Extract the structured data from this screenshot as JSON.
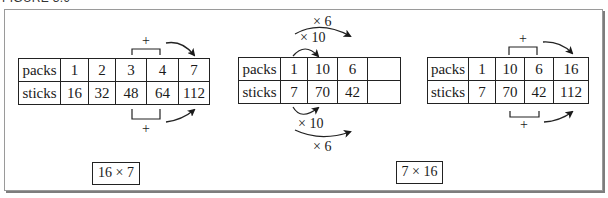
{
  "figure": {
    "title": "FIGURE 3.9"
  },
  "tables": [
    {
      "id": "left",
      "rows": [
        {
          "label": "packs",
          "values": [
            "1",
            "2",
            "3",
            "4",
            "7"
          ]
        },
        {
          "label": "sticks",
          "values": [
            "16",
            "32",
            "48",
            "64",
            "112"
          ]
        }
      ],
      "annotations": {
        "top_operator": "+",
        "bottom_operator": "+"
      },
      "result_label": "16 × 7"
    },
    {
      "id": "middle",
      "rows": [
        {
          "label": "packs",
          "values": [
            "1",
            "10",
            "6",
            ""
          ]
        },
        {
          "label": "sticks",
          "values": [
            "7",
            "70",
            "42",
            ""
          ]
        }
      ],
      "annotations": {
        "top_inner_operator": "× 10",
        "top_outer_operator": "× 6",
        "bottom_inner_operator": "× 10",
        "bottom_outer_operator": "× 6"
      }
    },
    {
      "id": "right",
      "rows": [
        {
          "label": "packs",
          "values": [
            "1",
            "10",
            "6",
            "16"
          ]
        },
        {
          "label": "sticks",
          "values": [
            "7",
            "70",
            "42",
            "112"
          ]
        }
      ],
      "annotations": {
        "top_operator": "+",
        "bottom_operator": "+"
      },
      "result_label": "7 × 16"
    }
  ]
}
